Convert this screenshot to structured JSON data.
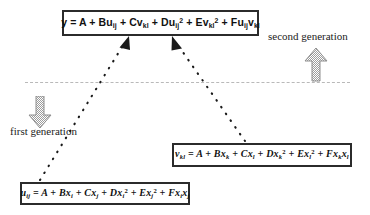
{
  "diagram": {
    "background_color": "#ffffff",
    "box_border_color": "#2b2b2b",
    "divider_color": "#b9b9b9",
    "arrow_fill_color": "#a9a9a9",
    "dotted_arrow_color": "#1a1a1a"
  },
  "boxes": {
    "top": {
      "name": "second-generation-equation",
      "equation_plain": "y = A + Bu_ij + Cv_kl + Du_ij^2 + Ev_kl^2 + Fu_ij v_kl",
      "parts": {
        "lhs": "y",
        "eq": "=",
        "t1": "A",
        "t2_coef": "B",
        "t2_var": "u",
        "t2_sub": "ij",
        "t3_coef": "C",
        "t3_var": "v",
        "t3_sub": "kl",
        "t4_coef": "D",
        "t4_var": "u",
        "t4_sub": "ij",
        "t4_sup": "2",
        "t5_coef": "E",
        "t5_var": "v",
        "t5_sub": "kl",
        "t5_sup": "2",
        "t6_coef": "F",
        "t6_var1": "u",
        "t6_sub1": "ij",
        "t6_var2": "v",
        "t6_sub2": "kl"
      }
    },
    "bottom_left": {
      "name": "u-equation",
      "equation_plain": "u_ij = A + Bx_i + Cx_j + Dx_i^2 + Ex_j^2 + Fx_i x_j",
      "parts": {
        "lhs_var": "u",
        "lhs_sub": "ij",
        "eq": "=",
        "t1": "A",
        "t2_coef": "B",
        "t2_var": "x",
        "t2_sub": "i",
        "t3_coef": "C",
        "t3_var": "x",
        "t3_sub": "j",
        "t4_coef": "D",
        "t4_var": "x",
        "t4_sub": "i",
        "t4_sup": "2",
        "t5_coef": "E",
        "t5_var": "x",
        "t5_sub": "j",
        "t5_sup": "2",
        "t6_coef": "F",
        "t6_var1": "x",
        "t6_sub1": "i",
        "t6_var2": "x",
        "t6_sub2": "j"
      }
    },
    "bottom_right": {
      "name": "v-equation",
      "equation_plain": "v_kl = A + Bx_k + Cx_l + Dx_k^2 + Ex_l^2 + Fx_k x_l",
      "parts": {
        "lhs_var": "v",
        "lhs_sub": "kl",
        "eq": "=",
        "t1": "A",
        "t2_coef": "B",
        "t2_var": "x",
        "t2_sub": "k",
        "t3_coef": "C",
        "t3_var": "x",
        "t3_sub": "l",
        "t4_coef": "D",
        "t4_var": "x",
        "t4_sub": "k",
        "t4_sup": "2",
        "t5_coef": "E",
        "t5_var": "x",
        "t5_sub": "l",
        "t5_sup": "2",
        "t6_coef": "F",
        "t6_var1": "x",
        "t6_sub1": "k",
        "t6_var2": "x",
        "t6_sub2": "l"
      }
    }
  },
  "labels": {
    "second_generation": "second generation",
    "first_generation": "first generation"
  },
  "operators": {
    "plus": "+"
  }
}
